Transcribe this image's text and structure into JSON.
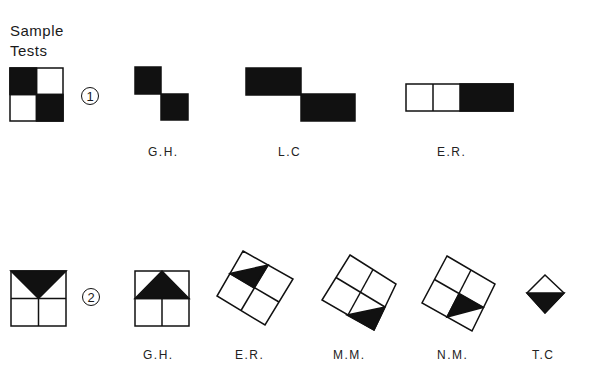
{
  "heading": {
    "line1": "Sample",
    "line2": "Tests"
  },
  "tests": [
    {
      "number": "1",
      "sample": "2x2 checkerboard: top-left and bottom-right black",
      "responses": [
        {
          "label": "G.H.",
          "description": "two black squares diagonal"
        },
        {
          "label": "L.C",
          "description": "two black rectangles diagonal"
        },
        {
          "label": "E.R.",
          "description": "row of three cells, rightmost black"
        }
      ]
    },
    {
      "number": "2",
      "sample": "2x2 grid with downward black triangle in top half",
      "responses": [
        {
          "label": "G.H.",
          "description": "2x2 grid with upward black triangle in top half"
        },
        {
          "label": "E.R.",
          "description": "rotated grid, triangle in top-left cell"
        },
        {
          "label": "M.M.",
          "description": "rotated grid, triangle in bottom cell"
        },
        {
          "label": "N.M.",
          "description": "rotated grid, triangle in bottom-right cell"
        },
        {
          "label": "T.C",
          "description": "diamond with lower half black"
        }
      ]
    }
  ],
  "colors": {
    "ink": "#111111",
    "paper": "#ffffff"
  }
}
